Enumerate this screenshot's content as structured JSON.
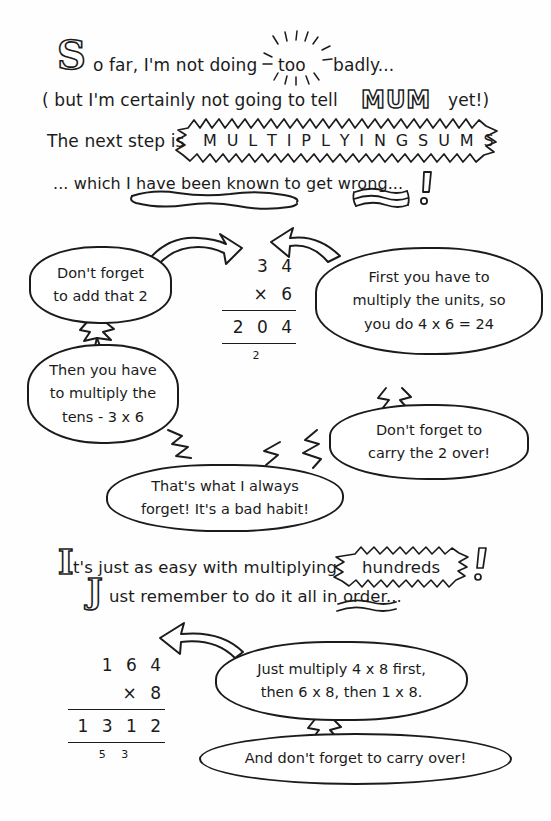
{
  "page": {
    "background": "#ffffff",
    "ink": "#1b1b1b"
  },
  "intro": {
    "line1_dropcap": "S",
    "line1_a": "o far, I'm not doing",
    "line1_emphasis": "too",
    "line1_b": "badly...",
    "line2_a": "( but I'm certainly  not  going to tell",
    "line2_emphasis": "MUM",
    "line2_b": "yet!)",
    "line3_a": "The next step is",
    "line3_burst": "M U L T I P L Y I N G   S U M S",
    "line4": "... which I have been known to get wrong...",
    "line4_bang": "!"
  },
  "sum1": {
    "multiplicand": "3 4",
    "operator_and_multiplier": "×   6",
    "product": "2 0 4",
    "carry": "2"
  },
  "sum1_bubbles": [
    {
      "name": "dont-forget-add-2",
      "lines": [
        "Don't forget",
        "to add that 2"
      ]
    },
    {
      "name": "first-multiply-units",
      "lines": [
        "First you have to",
        "multiply the units, so",
        "you do 4 x 6 = 24"
      ]
    },
    {
      "name": "then-multiply-tens",
      "lines": [
        "Then you have",
        "to multiply the",
        "tens -  3 x 6"
      ]
    },
    {
      "name": "dont-forget-carry-2",
      "lines": [
        "Don't forget to",
        "carry the 2 over!"
      ]
    },
    {
      "name": "thats-what-i-always-forget",
      "lines": [
        "That's what I always",
        "forget! It's a bad habit!"
      ]
    }
  ],
  "midtext": {
    "line1_dropcap": "I",
    "line1_a": "t's just as easy with multiplying",
    "line1_burst": "hundreds",
    "line1_bang": "!",
    "line2_dropcap": "J",
    "line2_a": "ust remember to do it all in order..."
  },
  "sum2": {
    "multiplicand": "1 6 4",
    "operator_and_multiplier": "×   8",
    "product": "1 3 1 2",
    "carry": "5  3"
  },
  "sum2_bubbles": [
    {
      "name": "just-multiply-order",
      "lines": [
        "Just multiply 4 x 8 first,",
        "then 6 x 8, then 1 x 8."
      ]
    },
    {
      "name": "and-dont-forget-carry-over",
      "lines": [
        "And don't forget to carry over!"
      ]
    }
  ]
}
